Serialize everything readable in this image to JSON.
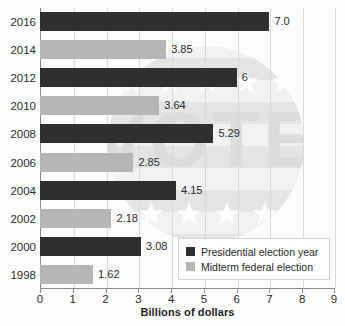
{
  "chart_data": {
    "type": "bar",
    "orientation": "horizontal",
    "title": "",
    "xlabel": "Billions of dollars",
    "ylabel": "",
    "xlim": [
      0,
      9
    ],
    "xticks": [
      "0",
      "1",
      "2",
      "3",
      "4",
      "5",
      "6",
      "7",
      "8",
      "9"
    ],
    "grid": true,
    "legend_position": "bottom-right",
    "categories": [
      "2016",
      "2014",
      "2012",
      "2010",
      "2008",
      "2006",
      "2004",
      "2002",
      "2000",
      "1998"
    ],
    "values": [
      7.0,
      3.85,
      6,
      3.64,
      5.29,
      2.85,
      4.15,
      2.18,
      3.08,
      1.62
    ],
    "value_labels": [
      "7.0",
      "3.85",
      "6",
      "3.64",
      "5.29",
      "2.85",
      "4.15",
      "2.18",
      "3.08",
      "1.62"
    ],
    "series": [
      {
        "name": "Presidential election year",
        "color": "#2f2f2f",
        "points": [
          {
            "category": "2016",
            "value": 7.0,
            "label": "7.0"
          },
          {
            "category": "2012",
            "value": 6,
            "label": "6"
          },
          {
            "category": "2008",
            "value": 5.29,
            "label": "5.29"
          },
          {
            "category": "2004",
            "value": 4.15,
            "label": "4.15"
          },
          {
            "category": "2000",
            "value": 3.08,
            "label": "3.08"
          }
        ]
      },
      {
        "name": "Midterm federal election",
        "color": "#b6b6b6",
        "points": [
          {
            "category": "2014",
            "value": 3.85,
            "label": "3.85"
          },
          {
            "category": "2010",
            "value": 3.64,
            "label": "3.64"
          },
          {
            "category": "2006",
            "value": 2.85,
            "label": "2.85"
          },
          {
            "category": "2002",
            "value": 2.18,
            "label": "2.18"
          },
          {
            "category": "1998",
            "value": 1.62,
            "label": "1.62"
          }
        ]
      }
    ],
    "bars": [
      {
        "category": "2016",
        "value": 7.0,
        "label": "7.0",
        "series": "presidential"
      },
      {
        "category": "2014",
        "value": 3.85,
        "label": "3.85",
        "series": "midterm"
      },
      {
        "category": "2012",
        "value": 6,
        "label": "6",
        "series": "presidential"
      },
      {
        "category": "2010",
        "value": 3.64,
        "label": "3.64",
        "series": "midterm"
      },
      {
        "category": "2008",
        "value": 5.29,
        "label": "5.29",
        "series": "presidential"
      },
      {
        "category": "2006",
        "value": 2.85,
        "label": "2.85",
        "series": "midterm"
      },
      {
        "category": "2004",
        "value": 4.15,
        "label": "4.15",
        "series": "presidential"
      },
      {
        "category": "2002",
        "value": 2.18,
        "label": "2.18",
        "series": "midterm"
      },
      {
        "category": "2000",
        "value": 3.08,
        "label": "3.08",
        "series": "presidential"
      },
      {
        "category": "1998",
        "value": 1.62,
        "label": "1.62",
        "series": "midterm"
      }
    ],
    "legend": [
      {
        "label": "Presidential election year",
        "color": "#2f2f2f",
        "key": "presidential"
      },
      {
        "label": "Midterm federal election",
        "color": "#b6b6b6",
        "key": "midterm"
      }
    ],
    "watermark": {
      "text": "VOTE",
      "visible": true
    }
  },
  "colors": {
    "presidential": "#2f2f2f",
    "midterm": "#b6b6b6",
    "axis": "#8c8c8c",
    "grid": "#d9d9d9",
    "text": "#2b2b2b",
    "background": "#fdfdfd"
  }
}
